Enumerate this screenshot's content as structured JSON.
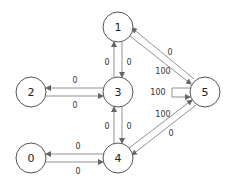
{
  "graph": {
    "nodes": [
      {
        "id": "0",
        "label": "0",
        "x": 31,
        "y": 158
      },
      {
        "id": "1",
        "label": "1",
        "x": 118,
        "y": 27
      },
      {
        "id": "2",
        "label": "2",
        "x": 31,
        "y": 92
      },
      {
        "id": "3",
        "label": "3",
        "x": 118,
        "y": 92
      },
      {
        "id": "4",
        "label": "4",
        "x": 118,
        "y": 158
      },
      {
        "id": "5",
        "label": "5",
        "x": 205,
        "y": 92
      }
    ],
    "edges": [
      {
        "from": "1",
        "to": "3",
        "label": "0"
      },
      {
        "from": "3",
        "to": "1",
        "label": "0"
      },
      {
        "from": "3",
        "to": "2",
        "label": "0"
      },
      {
        "from": "2",
        "to": "3",
        "label": "0"
      },
      {
        "from": "3",
        "to": "4",
        "label": "0"
      },
      {
        "from": "4",
        "to": "3",
        "label": "0"
      },
      {
        "from": "4",
        "to": "0",
        "label": "0"
      },
      {
        "from": "0",
        "to": "4",
        "label": "0"
      },
      {
        "from": "5",
        "to": "1",
        "label": "0"
      },
      {
        "from": "1",
        "to": "5",
        "label": "100"
      },
      {
        "from": "5",
        "to": "5",
        "label": "100"
      },
      {
        "from": "4",
        "to": "5",
        "label": "100"
      },
      {
        "from": "5",
        "to": "4",
        "label": "0"
      }
    ]
  },
  "labels": {
    "e13": "0",
    "e31": "0",
    "e32": "0",
    "e23": "0",
    "e34": "0",
    "e43": "0",
    "e40": "0",
    "e04": "0",
    "e51": "0",
    "e15": "100",
    "e55": "100",
    "e45": "100",
    "e54": "0"
  },
  "node_labels": {
    "n0": "0",
    "n1": "1",
    "n2": "2",
    "n3": "3",
    "n4": "4",
    "n5": "5"
  }
}
